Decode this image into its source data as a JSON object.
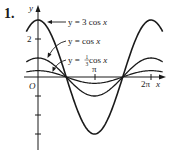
{
  "problem_number": "1.",
  "chart_data": {
    "type": "line",
    "title": "",
    "xlabel": "x",
    "ylabel": "y",
    "origin_label": "O",
    "x_ticks": [
      {
        "value": 3.14159,
        "label": "π"
      },
      {
        "value": 6.28318,
        "label": "2π"
      }
    ],
    "y_ticks": [
      {
        "value": 2,
        "label": "2"
      },
      {
        "value": -1,
        "label": ""
      },
      {
        "value": -2,
        "label": ""
      },
      {
        "value": -3,
        "label": ""
      }
    ],
    "xlim": [
      -0.6,
      7.0
    ],
    "ylim": [
      -3.8,
      3.4
    ],
    "grid": false,
    "legend_position": "annotations with arrows, upper right of peak",
    "series": [
      {
        "name": "y = 3 cos x",
        "amplitude": 3,
        "function": "3cos(x)",
        "x_range": [
          -0.65,
          6.93
        ]
      },
      {
        "name": "y = cos x",
        "amplitude": 1,
        "function": "cos(x)",
        "x_range": [
          -0.65,
          6.93
        ]
      },
      {
        "name": "y = 1/3 cos x",
        "amplitude": 0.3333,
        "function": "(1/3)cos(x)",
        "x_range": [
          -0.65,
          6.93
        ]
      }
    ],
    "annotations": [
      {
        "text": "y = 3 cos x",
        "points_to": "y = 3 cos x"
      },
      {
        "text": "y = cos x",
        "points_to": "y = cos x"
      },
      {
        "text": "y = ⅓ cos x",
        "points_to": "y = 1/3 cos x"
      }
    ]
  },
  "labels": {
    "y_axis": "y",
    "x_axis": "x",
    "origin": "O",
    "tick_two": "2",
    "tick_pi": "π",
    "tick_2pi": "2π",
    "ann_3cos_prefix": "y = 3 cos ",
    "ann_cos_prefix": "y = cos ",
    "ann_third_prefix": "y = ",
    "ann_third_suffix": " cos ",
    "var_x": "x",
    "frac_num": "1",
    "frac_den": "3"
  }
}
